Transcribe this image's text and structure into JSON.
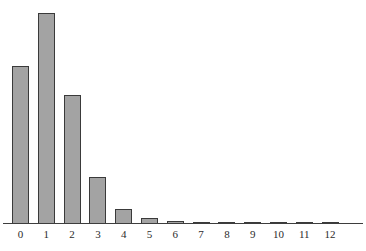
{
  "chart_data": {
    "type": "bar",
    "title": "",
    "subtitle": "",
    "xlabel": "",
    "ylabel": "",
    "categories": [
      "0",
      "1",
      "2",
      "3",
      "4",
      "5",
      "6",
      "7",
      "8",
      "9",
      "10",
      "11",
      "12"
    ],
    "values": [
      0.301,
      0.361,
      0.217,
      0.087,
      0.026,
      0.0063,
      0.0013,
      0.0002,
      0.0001,
      0.0001,
      0.0001,
      0.0001,
      0.0001
    ],
    "bar_pixel_heights": [
      158,
      211,
      129,
      47,
      15,
      6,
      3,
      2,
      2,
      2,
      2,
      2,
      2
    ],
    "ylim": [
      0,
      0.38
    ],
    "xlim": [
      -0.5,
      12.5
    ],
    "grid": false,
    "legend": null,
    "legend_position": "none",
    "axis": {
      "x_axis_visible": true,
      "y_axis_visible": false,
      "tick_labels": [
        "0",
        "1",
        "2",
        "3",
        "4",
        "5",
        "6",
        "7",
        "8",
        "9",
        "10",
        "11",
        "12"
      ]
    },
    "colors": {
      "bar_fill": "#a3a3a3",
      "bar_stroke": "#3a3a3a",
      "axis": "#3d3d3d",
      "tick_text": "#2b2b2b",
      "background": "#ffffff"
    },
    "annotations": []
  },
  "layout": {
    "bar_width_px": 17,
    "bar_spacing_px": 25.8,
    "first_bar_left_px": 12,
    "baseline_y_px": 223
  }
}
